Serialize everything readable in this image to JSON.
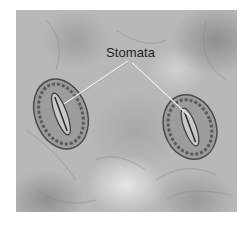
{
  "figure": {
    "label": "Stomata",
    "structures": [
      {
        "name": "stoma-left",
        "center": [
          61,
          104
        ]
      },
      {
        "name": "stoma-right",
        "center": [
          190,
          117
        ]
      }
    ]
  },
  "colors": {
    "background": "#b8b8b8",
    "label_text": "#1e1e1e",
    "leader_line": "#f0f0f0"
  }
}
